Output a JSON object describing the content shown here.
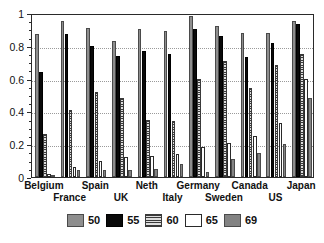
{
  "chart_data": {
    "type": "bar",
    "title": "",
    "subtitle": "",
    "xlabel": "",
    "ylabel": "",
    "ylim": [
      0,
      1
    ],
    "yticks": [
      0,
      0.2,
      0.4,
      0.6,
      0.8,
      1
    ],
    "ytick_labels": [
      "0",
      "0.2",
      "0.4",
      "0.6",
      "0.8",
      "1"
    ],
    "grid": true,
    "legend_position": "bottom",
    "categories": [
      "Belgium",
      "France",
      "Spain",
      "UK",
      "Neth",
      "Italy",
      "Germany",
      "Sweden",
      "Canada",
      "US",
      "Japan"
    ],
    "series": [
      {
        "name": "50",
        "color": "#8e8e8e",
        "pattern": "dotted-gray",
        "values": [
          0.87,
          0.95,
          0.91,
          0.83,
          0.9,
          0.89,
          0.98,
          0.92,
          0.88,
          0.88,
          0.95
        ]
      },
      {
        "name": "55",
        "color": "#0a0a0a",
        "pattern": "solid-black",
        "values": [
          0.64,
          0.87,
          0.8,
          0.74,
          0.77,
          0.75,
          0.9,
          0.86,
          0.73,
          0.82,
          0.93
        ]
      },
      {
        "name": "60",
        "color": "#d8d8d8",
        "pattern": "horizontal-lines",
        "values": [
          0.26,
          0.41,
          0.52,
          0.48,
          0.35,
          0.34,
          0.6,
          0.71,
          0.545,
          0.68,
          0.75
        ]
      },
      {
        "name": "65",
        "color": "#ffffff",
        "pattern": "white",
        "values": [
          0.02,
          0.06,
          0.1,
          0.12,
          0.13,
          0.14,
          0.18,
          0.21,
          0.25,
          0.33,
          0.6
        ]
      },
      {
        "name": "69",
        "color": "#838383",
        "pattern": "solid-gray",
        "values": [
          0.005,
          0.04,
          0.04,
          0.04,
          0.05,
          0.08,
          0.03,
          0.11,
          0.145,
          0.2,
          0.48
        ]
      }
    ]
  },
  "axis": {
    "y_ticks": [
      "0",
      "0.2",
      "0.4",
      "0.6",
      "0.8",
      "1"
    ]
  },
  "x_axis": {
    "row1": [
      "Belgium",
      "Spain",
      "Neth",
      "Germany",
      "Canada",
      "Japan"
    ],
    "row2": [
      "France",
      "UK",
      "Italy",
      "Sweden",
      "US"
    ]
  },
  "legend": {
    "entries": [
      {
        "label": "50"
      },
      {
        "label": "55"
      },
      {
        "label": "60"
      },
      {
        "label": "65"
      },
      {
        "label": "69"
      }
    ]
  }
}
